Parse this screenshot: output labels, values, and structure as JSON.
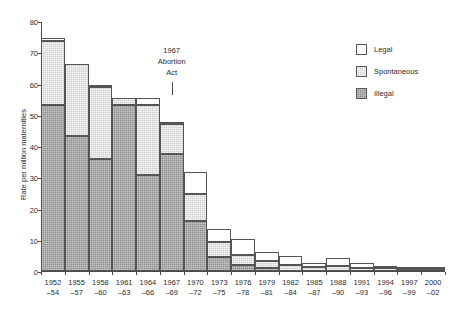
{
  "chart_data": {
    "type": "bar",
    "subtype": "stacked-bar",
    "title": "",
    "xlabel": "",
    "ylabel": "Rate per million maternities",
    "ylim": [
      0,
      80
    ],
    "yticks": [
      0,
      10,
      20,
      30,
      40,
      50,
      60,
      70,
      80
    ],
    "grid": false,
    "legend_position": "top-right",
    "categories": [
      "1952––54",
      "1955––57",
      "1958––60",
      "1961––63",
      "1964––66",
      "1967––69",
      "1970––72",
      "1973––75",
      "1976––78",
      "1979––81",
      "1982––84",
      "1985––87",
      "1988––90",
      "1991––93",
      "1994––96",
      "1997––99",
      "2000––02"
    ],
    "category_lines": [
      [
        "1952",
        "–54"
      ],
      [
        "1955",
        "–57"
      ],
      [
        "1958",
        "–60"
      ],
      [
        "1961",
        "–63"
      ],
      [
        "1964",
        "–66"
      ],
      [
        "1967",
        "–69"
      ],
      [
        "1970",
        "–72"
      ],
      [
        "1973",
        "–75"
      ],
      [
        "1976",
        "–78"
      ],
      [
        "1979",
        "–81"
      ],
      [
        "1982",
        "–84"
      ],
      [
        "1985",
        "–87"
      ],
      [
        "1988",
        "–90"
      ],
      [
        "1991",
        "–93"
      ],
      [
        "1994",
        "–96"
      ],
      [
        "1997",
        "–99"
      ],
      [
        "2000",
        "–02"
      ]
    ],
    "series": [
      {
        "name": "Illegal",
        "color": "#8e8e8e",
        "values": [
          53.0,
          43.2,
          35.8,
          53.0,
          30.6,
          37.5,
          16.0,
          4.5,
          2.0,
          0.9,
          0.0,
          0.0,
          0.0,
          0.0,
          0.0,
          0.0,
          0.0
        ]
      },
      {
        "name": "Spontaneous",
        "color": "#cfcfcf",
        "values": [
          20.5,
          23.0,
          23.0,
          2.4,
          22.4,
          9.5,
          8.8,
          4.8,
          3.1,
          2.3,
          1.8,
          1.2,
          1.6,
          1.0,
          0.9,
          0.6,
          0.6
        ]
      },
      {
        "name": "Legal",
        "color": "#ffffff",
        "values": [
          1.0,
          0.0,
          0.5,
          0.0,
          2.5,
          0.5,
          6.8,
          4.3,
          5.0,
          3.0,
          3.0,
          1.5,
          2.6,
          1.7,
          0.4,
          0.6,
          0.8
        ]
      }
    ],
    "totals": [
      74.5,
      66.2,
      59.3,
      55.4,
      55.5,
      47.5,
      31.6,
      13.6,
      10.1,
      6.2,
      4.8,
      2.7,
      4.2,
      2.7,
      1.3,
      1.2,
      1.4
    ],
    "annotations": [
      {
        "name": "abortion-act-annotation",
        "lines": [
          "1967",
          "Abortion",
          "Act"
        ],
        "points_to_category": "1967––69"
      }
    ]
  },
  "legend": {
    "items": [
      {
        "label": "Legal",
        "key": "legal"
      },
      {
        "label": "Spontaneous",
        "key": "spontaneous"
      },
      {
        "label": "Illegal",
        "key": "illegal"
      }
    ]
  }
}
